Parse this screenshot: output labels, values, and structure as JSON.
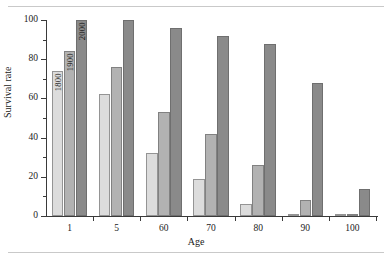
{
  "figure": {
    "caption_remnant": "",
    "x_axis_title": "Age",
    "y_axis_title": "Survival rate"
  },
  "chart_data": {
    "type": "bar",
    "title": "",
    "xlabel": "Age",
    "ylabel": "Survival rate",
    "categories": [
      "1",
      "5",
      "60",
      "70",
      "80",
      "90",
      "100"
    ],
    "series": [
      {
        "name": "1800",
        "color": "#dcdcdc",
        "values": [
          74,
          62,
          32,
          19,
          6,
          1,
          0
        ]
      },
      {
        "name": "1900",
        "color": "#b2b2b2",
        "values": [
          84,
          76,
          53,
          42,
          26,
          8,
          1
        ]
      },
      {
        "name": "2000",
        "color": "#8a8a8a",
        "values": [
          100,
          100,
          96,
          92,
          88,
          68,
          14
        ]
      }
    ],
    "ylim": [
      0,
      100
    ],
    "yticks": [
      0,
      20,
      40,
      60,
      80,
      100
    ],
    "yticks_minor": [
      10,
      30,
      50,
      70,
      90
    ],
    "ytick_labels": [
      "0",
      "20",
      "40",
      "60",
      "80",
      "100"
    ],
    "grid": false,
    "legend": "inline-bar-labels",
    "bar_labels_group": "1",
    "bar_label_rotation": -90
  }
}
